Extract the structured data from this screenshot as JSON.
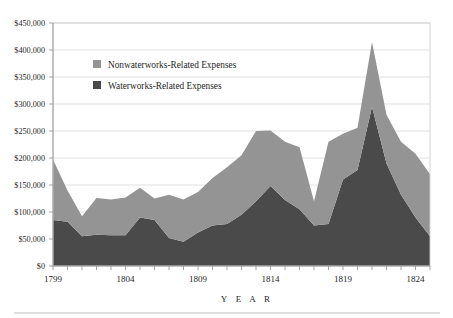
{
  "chart_data": {
    "type": "area",
    "stacked": true,
    "title": "",
    "subtitle": "",
    "xlabel": "Y E A R",
    "ylabel": "",
    "grid": true,
    "legend_position": "inside-top-left",
    "xlim": [
      1799,
      1825
    ],
    "ylim": [
      0,
      450000
    ],
    "y_ticks": [
      0,
      50000,
      100000,
      150000,
      200000,
      250000,
      300000,
      350000,
      400000,
      450000
    ],
    "y_tick_labels": [
      "$0",
      "$50,000",
      "$100,000",
      "$150,000",
      "$200,000",
      "$250,000",
      "$300,000",
      "$350,000",
      "$400,000",
      "$450,000"
    ],
    "x_ticks": [
      1799,
      1804,
      1809,
      1814,
      1819,
      1824
    ],
    "x_tick_labels": [
      "1799",
      "1804",
      "1809",
      "1814",
      "1819",
      "1824"
    ],
    "x": [
      1799,
      1800,
      1801,
      1802,
      1803,
      1804,
      1805,
      1806,
      1807,
      1808,
      1809,
      1810,
      1811,
      1812,
      1813,
      1814,
      1815,
      1816,
      1817,
      1818,
      1819,
      1820,
      1821,
      1822,
      1823,
      1824,
      1825
    ],
    "series": [
      {
        "name": "Waterworks-Related Expenses",
        "color": "#4a4a4a",
        "values": [
          85000,
          82000,
          55000,
          58000,
          57000,
          57000,
          90000,
          85000,
          52000,
          45000,
          62000,
          75000,
          78000,
          95000,
          120000,
          148000,
          122000,
          105000,
          75000,
          78000,
          160000,
          178000,
          295000,
          190000,
          132000,
          90000,
          55000
        ]
      },
      {
        "name": "Nonwaterworks-Related Expenses",
        "color": "#949494",
        "values": [
          112000,
          58000,
          37000,
          68000,
          66000,
          70000,
          55000,
          40000,
          80000,
          78000,
          75000,
          88000,
          105000,
          110000,
          130000,
          103000,
          108000,
          115000,
          45000,
          152000,
          85000,
          78000,
          120000,
          90000,
          98000,
          118000,
          115000
        ]
      }
    ]
  },
  "legend": {
    "items": [
      {
        "label": "Nonwaterworks-Related Expenses",
        "color": "#949494"
      },
      {
        "label": "Waterworks-Related Expenses",
        "color": "#4a4a4a"
      }
    ]
  }
}
